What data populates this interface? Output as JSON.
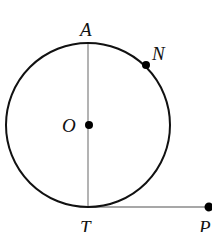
{
  "diagram": {
    "type": "geometry",
    "colors": {
      "background": "#ffffff",
      "circle_stroke": "#111111",
      "segment_stroke": "#8a8a8a",
      "point_fill": "#000000",
      "label": "#111111"
    },
    "circle": {
      "name": "circle-O",
      "cx": 88,
      "cy": 125,
      "r": 82
    },
    "segments": [
      {
        "name": "diameter-AT",
        "from": "A",
        "to": "T"
      },
      {
        "name": "tangent-TP",
        "from": "T",
        "to": "P"
      }
    ],
    "points": [
      {
        "id": "A",
        "label": "A",
        "x": 88,
        "y": 43,
        "dot": false,
        "label_x": 80,
        "label_y": 36
      },
      {
        "id": "N",
        "label": "N",
        "x": 146,
        "y": 65,
        "dot": true,
        "label_x": 152,
        "label_y": 60
      },
      {
        "id": "O",
        "label": "O",
        "x": 89,
        "y": 125,
        "dot": true,
        "label_x": 62,
        "label_y": 132
      },
      {
        "id": "T",
        "label": "T",
        "x": 88,
        "y": 207,
        "dot": false,
        "label_x": 80,
        "label_y": 234
      },
      {
        "id": "P",
        "label": "P",
        "x": 209,
        "y": 207,
        "dot": true,
        "label_x": 199,
        "label_y": 234
      }
    ]
  }
}
